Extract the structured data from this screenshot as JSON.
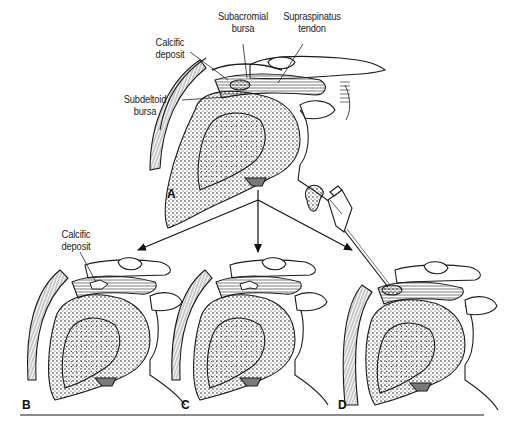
{
  "figure": {
    "panels": [
      {
        "id": "A",
        "letter": "A",
        "description": "Shoulder with calcific deposit in supraspinatus tendon"
      },
      {
        "id": "B",
        "letter": "B",
        "description": "Calcific deposit rupturing into bursa"
      },
      {
        "id": "C",
        "letter": "C",
        "description": "Calcific deposit resorbing"
      },
      {
        "id": "D",
        "letter": "D",
        "description": "Needle aspiration of calcific deposit"
      }
    ],
    "labels": {
      "subacromial_bursa": {
        "line1": "Subacromial",
        "line2": "bursa"
      },
      "supraspinatus_tendon": {
        "line1": "Supraspinatus",
        "line2": "tendon"
      },
      "calcific_deposit_a": {
        "line1": "Calcific",
        "line2": "deposit"
      },
      "subdeltoid_bursa": {
        "line1": "Subdeltoid",
        "line2": "bursa"
      },
      "calcific_deposit_b": {
        "line1": "Calcific",
        "line2": "deposit"
      }
    },
    "colors": {
      "ink": "#1a1a1a",
      "shade": "#7a7a7a",
      "rule": "#8a8a8a",
      "background": "#ffffff"
    }
  }
}
